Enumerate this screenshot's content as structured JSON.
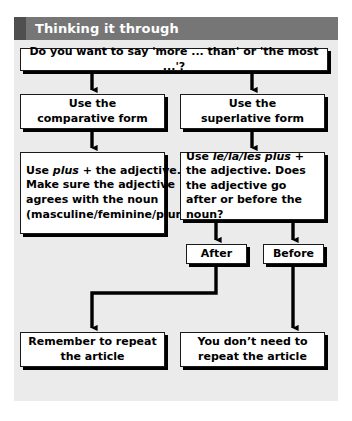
{
  "header": {
    "title": "Thinking it through"
  },
  "flowchart": {
    "nodes": {
      "question": {
        "text": "Do you want to say 'more ... than' or 'the most ...'?"
      },
      "comparative": {
        "line1": "Use the",
        "line2": "comparative form"
      },
      "superlative": {
        "line1": "Use the",
        "line2": "superlative form"
      },
      "plus_rule": {
        "before_italic": "Use ",
        "italic": "plus",
        "after_italic": " + the adjective. Make sure the adjective agrees with the noun (masculine/feminine/plural)"
      },
      "les_rule": {
        "before_italic": "Use ",
        "italic": "le/la/les plus",
        "after_italic": " + the adjective. Does the adjective go after or before the noun?"
      },
      "after": {
        "label": "After"
      },
      "before": {
        "label": "Before"
      },
      "repeat": {
        "line1": "Remember to repeat",
        "line2": "the article"
      },
      "no_repeat": {
        "line1": "You don’t need to",
        "line2": "repeat the article"
      }
    }
  },
  "colors": {
    "header_bar": "#767676",
    "header_accent": "#4f4f4f",
    "panel_background": "#ebebeb",
    "node_fill": "#ffffff",
    "node_border": "#1a1a1a",
    "shadow": "#000000",
    "connector": "#000000",
    "header_text": "#ffffff",
    "node_text": "#000000"
  }
}
